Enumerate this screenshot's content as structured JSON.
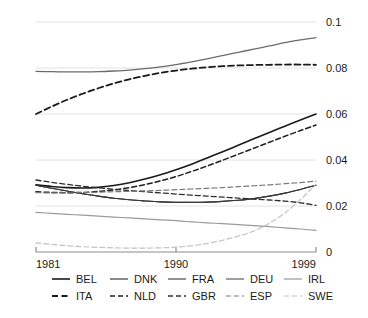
{
  "chart_data": {
    "type": "line",
    "title": "",
    "subtitle": "",
    "xlabel": "",
    "ylabel": "",
    "xlim": [
      1981,
      1999
    ],
    "ylim": [
      0,
      0.1
    ],
    "grid": true,
    "grid_axis": "y",
    "legend_position": "bottom",
    "legend_columns": 5,
    "legend_rows": 2,
    "x": [
      1981,
      1982,
      1983,
      1984,
      1985,
      1986,
      1987,
      1988,
      1989,
      1990,
      1991,
      1992,
      1993,
      1994,
      1995,
      1996,
      1997,
      1998,
      1999
    ],
    "xticks": [
      1981,
      1990,
      1999
    ],
    "xticklabels": [
      "1981",
      "1990",
      "1999"
    ],
    "yticks": [
      0,
      0.02,
      0.04,
      0.06,
      0.08,
      0.1
    ],
    "yticklabels": [
      "0",
      "0.02",
      "0.04",
      "0.06",
      "0.08",
      "0.1"
    ],
    "series": [
      {
        "name": "BEL",
        "style": "solid",
        "color": "#1a1a1a",
        "width": 1.6,
        "values": [
          0.0292,
          0.0285,
          0.028,
          0.0278,
          0.0281,
          0.0289,
          0.0301,
          0.0317,
          0.0336,
          0.0358,
          0.0382,
          0.0409,
          0.0436,
          0.0464,
          0.0492,
          0.052,
          0.0547,
          0.0574,
          0.06
        ]
      },
      {
        "name": "DNK",
        "style": "solid",
        "color": "#2b2b2b",
        "width": 1.1,
        "values": [
          0.029,
          0.0277,
          0.0265,
          0.0253,
          0.0243,
          0.0234,
          0.0227,
          0.0222,
          0.0218,
          0.0216,
          0.0216,
          0.0217,
          0.022,
          0.0225,
          0.0232,
          0.0243,
          0.0256,
          0.0272,
          0.029
        ]
      },
      {
        "name": "FRA",
        "style": "solid",
        "color": "#3a3a3a",
        "width": 1.1,
        "values": [
          0.029,
          0.0277,
          0.0265,
          0.0253,
          0.0243,
          0.0234,
          0.0227,
          0.0222,
          0.0218,
          0.0216,
          0.0216,
          0.0217,
          0.022,
          0.0225,
          0.0232,
          0.0243,
          0.0256,
          0.0272,
          0.029
        ]
      },
      {
        "name": "DEU",
        "style": "solid",
        "color": "#6b6b6b",
        "width": 1.3,
        "values": [
          0.0785,
          0.0784,
          0.0783,
          0.0783,
          0.0784,
          0.0787,
          0.0791,
          0.0797,
          0.0805,
          0.0815,
          0.0827,
          0.084,
          0.0854,
          0.0868,
          0.0882,
          0.0896,
          0.091,
          0.0922,
          0.0932
        ]
      },
      {
        "name": "IRL",
        "style": "solid",
        "color": "#9a9a9a",
        "width": 1.2,
        "values": [
          0.0172,
          0.0168,
          0.0164,
          0.016,
          0.0156,
          0.0152,
          0.0148,
          0.0144,
          0.014,
          0.0136,
          0.0131,
          0.0127,
          0.0123,
          0.0119,
          0.0115,
          0.011,
          0.0105,
          0.01,
          0.0094
        ]
      },
      {
        "name": "ITA",
        "style": "dashed",
        "color": "#1a1a1a",
        "width": 1.8,
        "values": [
          0.06,
          0.0632,
          0.0662,
          0.0688,
          0.0712,
          0.0733,
          0.0751,
          0.0766,
          0.0779,
          0.0789,
          0.0797,
          0.0803,
          0.0808,
          0.0811,
          0.0813,
          0.0814,
          0.0815,
          0.0815,
          0.0814
        ]
      },
      {
        "name": "NLD",
        "style": "dashed",
        "color": "#1f1f1f",
        "width": 1.5,
        "values": [
          0.0262,
          0.0259,
          0.0258,
          0.0259,
          0.0263,
          0.027,
          0.028,
          0.0293,
          0.0309,
          0.0328,
          0.035,
          0.0374,
          0.0399,
          0.0425,
          0.0451,
          0.0477,
          0.0503,
          0.0528,
          0.0552
        ]
      },
      {
        "name": "GBR",
        "style": "dashed",
        "color": "#2e2e2e",
        "width": 1.3,
        "values": [
          0.0313,
          0.0303,
          0.0294,
          0.0286,
          0.0279,
          0.0273,
          0.0267,
          0.0262,
          0.0257,
          0.0252,
          0.0247,
          0.0243,
          0.0239,
          0.0234,
          0.023,
          0.0226,
          0.0221,
          0.0214,
          0.0203
        ]
      },
      {
        "name": "ESP",
        "style": "dashed",
        "color": "#7a7a7a",
        "width": 1.2,
        "values": [
          0.0258,
          0.0257,
          0.0257,
          0.0258,
          0.026,
          0.0262,
          0.0264,
          0.0266,
          0.0268,
          0.0271,
          0.0274,
          0.0277,
          0.028,
          0.0284,
          0.0288,
          0.0292,
          0.0297,
          0.0302,
          0.0308
        ]
      },
      {
        "name": "SWE",
        "style": "dashed",
        "color": "#c2c2c2",
        "width": 1.2,
        "values": [
          0.004,
          0.0033,
          0.0027,
          0.0023,
          0.002,
          0.0018,
          0.0017,
          0.0017,
          0.0018,
          0.0021,
          0.0027,
          0.0037,
          0.0051,
          0.0069,
          0.0091,
          0.0125,
          0.017,
          0.0228,
          0.0295
        ]
      }
    ]
  },
  "legend": {
    "row1": [
      {
        "label": "BEL",
        "series": "BEL"
      },
      {
        "label": "DNK",
        "series": "DNK"
      },
      {
        "label": "FRA",
        "series": "FRA"
      },
      {
        "label": "DEU",
        "series": "DEU"
      },
      {
        "label": "IRL",
        "series": "IRL"
      }
    ],
    "row2": [
      {
        "label": "ITA",
        "series": "ITA"
      },
      {
        "label": "NLD",
        "series": "NLD"
      },
      {
        "label": "GBR",
        "series": "GBR"
      },
      {
        "label": "ESP",
        "series": "ESP"
      },
      {
        "label": "SWE",
        "series": "SWE"
      }
    ]
  },
  "colors": {
    "background": "#ffffff",
    "grid": "#e2e2e2",
    "axis": "#8c8c8c",
    "text": "#1a1a1a"
  }
}
